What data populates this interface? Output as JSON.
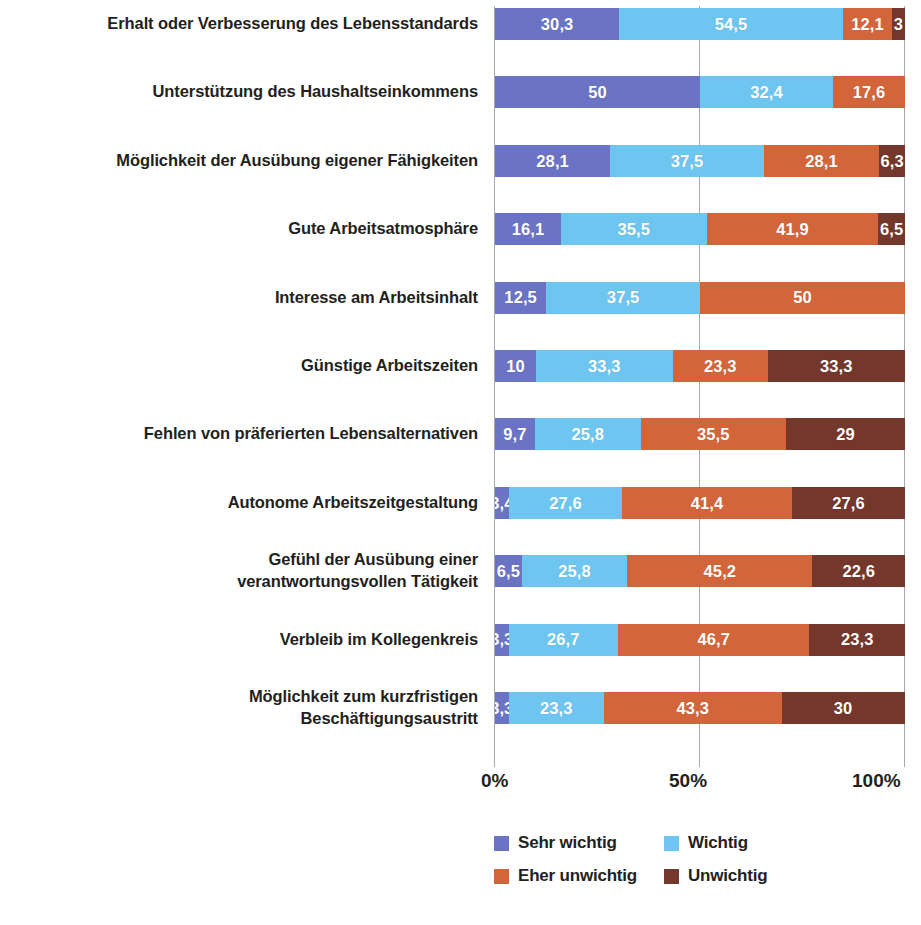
{
  "chart_data": {
    "type": "bar",
    "orientation": "horizontal",
    "stacked": true,
    "normalized": "100%",
    "title": "",
    "xlabel": "",
    "ylabel": "",
    "xlim": [
      0,
      100
    ],
    "xticks": [
      "0%",
      "50%",
      "100%"
    ],
    "xtick_values": [
      0,
      50,
      100
    ],
    "grid": true,
    "legend_position": "bottom",
    "value_decimal_separator": ",",
    "categories": [
      "Erhalt oder Verbesserung des Lebensstandards",
      "Unterstützung des Haushaltseinkommens",
      "Möglichkeit der Ausübung eigener Fähigkeiten",
      "Gute Arbeitsatmosphäre",
      "Interesse am Arbeitsinhalt",
      "Günstige Arbeitszeiten",
      "Fehlen von präferierten Lebensalternativen",
      "Autonome Arbeitszeitgestaltung",
      "Gefühl der Ausübung einer verantwortungsvollen Tätigkeit",
      "Verbleib im Kollegenkreis",
      "Möglichkeit zum kurzfristigen Beschäftigungsaustritt"
    ],
    "category_lines": [
      [
        "Erhalt oder Verbesserung des Lebensstandards"
      ],
      [
        "Unterstützung des Haushaltseinkommens"
      ],
      [
        "Möglichkeit der Ausübung eigener Fähigkeiten"
      ],
      [
        "Gute Arbeitsatmosphäre"
      ],
      [
        "Interesse am Arbeitsinhalt"
      ],
      [
        "Günstige Arbeitszeiten"
      ],
      [
        "Fehlen von präferierten Lebensalternativen"
      ],
      [
        "Autonome Arbeitszeitgestaltung"
      ],
      [
        "Gefühl der Ausübung einer",
        "verantwortungsvollen Tätigkeit"
      ],
      [
        "Verbleib im Kollegenkreis"
      ],
      [
        "Möglichkeit zum kurzfristigen",
        "Beschäftigungsaustritt"
      ]
    ],
    "series": [
      {
        "name": "Sehr wichtig",
        "color": "#6B73C4",
        "values": [
          30.3,
          50,
          28.1,
          16.1,
          12.5,
          10,
          9.7,
          3.4,
          6.5,
          3.3,
          3.3
        ],
        "labels": [
          "30,3",
          "50",
          "28,1",
          "16,1",
          "12,5",
          "10",
          "9,7",
          "3,4",
          "6,5",
          "3,3",
          "3,3"
        ]
      },
      {
        "name": "Wichtig",
        "color": "#6EC6F0",
        "values": [
          54.5,
          32.4,
          37.5,
          35.5,
          37.5,
          33.3,
          25.8,
          27.6,
          25.8,
          26.7,
          23.3
        ],
        "labels": [
          "54,5",
          "32,4",
          "37,5",
          "35,5",
          "37,5",
          "33,3",
          "25,8",
          "27,6",
          "25,8",
          "26,7",
          "23,3"
        ]
      },
      {
        "name": "Eher unwichtig",
        "color": "#D2653A",
        "values": [
          12.1,
          17.6,
          28.1,
          41.9,
          50,
          23.3,
          35.5,
          41.4,
          45.2,
          46.7,
          43.3
        ],
        "labels": [
          "12,1",
          "17,6",
          "28,1",
          "41,9",
          "50",
          "23,3",
          "35,5",
          "41,4",
          "45,2",
          "46,7",
          "43,3"
        ]
      },
      {
        "name": "Unwichtig",
        "color": "#74372C",
        "values": [
          3,
          0,
          6.3,
          6.5,
          0,
          33.3,
          29,
          27.6,
          22.6,
          23.3,
          30
        ],
        "labels": [
          "3",
          "",
          "6,3",
          "6,5",
          "",
          "33,3",
          "29",
          "27,6",
          "22,6",
          "23,3",
          "30"
        ]
      }
    ]
  },
  "legend": {
    "items": [
      {
        "label": "Sehr wichtig",
        "color": "#6B73C4"
      },
      {
        "label": "Wichtig",
        "color": "#6EC6F0"
      },
      {
        "label": "Eher unwichtig",
        "color": "#D2653A"
      },
      {
        "label": "Unwichtig",
        "color": "#74372C"
      }
    ]
  },
  "axis": {
    "x_tick_labels": [
      "0%",
      "50%",
      "100%"
    ]
  }
}
